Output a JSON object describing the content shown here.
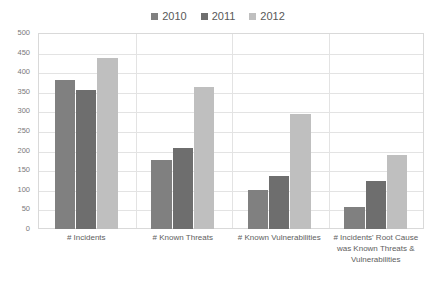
{
  "chart_data": {
    "type": "bar",
    "title": "",
    "subtitle": "",
    "xlabel": "",
    "ylabel": "",
    "ylim": [
      0,
      500
    ],
    "ytick_step": 50,
    "yticks": [
      "500",
      "450",
      "400",
      "350",
      "300",
      "250",
      "200",
      "150",
      "100",
      "50",
      "0"
    ],
    "grid": true,
    "legend_position": "top-center",
    "categories": [
      "# Incidents",
      "# Known Threats",
      "# Known Vulnerabilities",
      "# Incidents' Root Cause was Known Threats & Vulnerabilities"
    ],
    "category_lines": [
      [
        "# Incidents"
      ],
      [
        "# Known Threats"
      ],
      [
        "# Known Vulnerabilities"
      ],
      [
        "# Incidents' Root Cause",
        "was Known Threats &",
        "Vulnerabilities"
      ]
    ],
    "series": [
      {
        "name": "2010",
        "color": "#808080",
        "values": [
          380,
          175,
          100,
          55
        ]
      },
      {
        "name": "2011",
        "color": "#6e6e6e",
        "values": [
          355,
          207,
          135,
          123
        ]
      },
      {
        "name": "2012",
        "color": "#bfbfbf",
        "values": [
          435,
          363,
          293,
          190
        ]
      }
    ]
  },
  "legend": {
    "entries": [
      {
        "label": "2010",
        "color": "#808080"
      },
      {
        "label": "2011",
        "color": "#6e6e6e"
      },
      {
        "label": "2012",
        "color": "#bfbfbf"
      }
    ]
  }
}
